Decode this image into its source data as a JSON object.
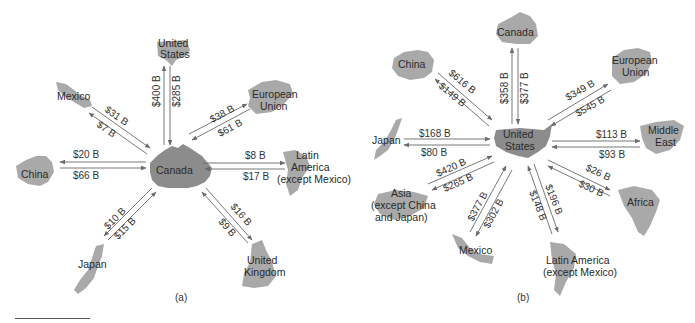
{
  "panels": [
    {
      "id": "a",
      "caption": "(a)",
      "hub": {
        "label": "Canada"
      },
      "partners": [
        {
          "key": "us",
          "label_lines": [
            "United",
            "States"
          ],
          "to_hub": "$400 B",
          "from_hub": "$285 B"
        },
        {
          "key": "eu",
          "label_lines": [
            "European",
            "Union"
          ],
          "to_hub": "$61 B",
          "from_hub": "$38 B"
        },
        {
          "key": "latam",
          "label_lines": [
            "Latin",
            "America",
            "(except Mexico)"
          ],
          "to_hub": "$17 B",
          "from_hub": "$8 B"
        },
        {
          "key": "uk",
          "label_lines": [
            "United",
            "Kingdom"
          ],
          "to_hub": "$9 B",
          "from_hub": "$16 B"
        },
        {
          "key": "japan",
          "label_lines": [
            "Japan"
          ],
          "to_hub": "$15 B",
          "from_hub": "$10 B"
        },
        {
          "key": "china",
          "label_lines": [
            "China"
          ],
          "to_hub": "$66 B",
          "from_hub": "$20 B"
        },
        {
          "key": "mexico",
          "label_lines": [
            "Mexico"
          ],
          "to_hub": "$31 B",
          "from_hub": "$7 B"
        }
      ]
    },
    {
      "id": "b",
      "caption": "(b)",
      "hub": {
        "label_lines": [
          "United",
          "States"
        ]
      },
      "partners": [
        {
          "key": "canada",
          "label_lines": [
            "Canada"
          ],
          "to_hub": "$377 B",
          "from_hub": "$358 B"
        },
        {
          "key": "eu",
          "label_lines": [
            "European",
            "Union"
          ],
          "to_hub": "$545 B",
          "from_hub": "$349 B"
        },
        {
          "key": "mideast",
          "label_lines": [
            "Middle",
            "East"
          ],
          "to_hub": "$93 B",
          "from_hub": "$113 B"
        },
        {
          "key": "africa",
          "label_lines": [
            "Africa"
          ],
          "to_hub": "$30 B",
          "from_hub": "$26 B"
        },
        {
          "key": "latam",
          "label_lines": [
            "Latin America",
            "(except Mexico)"
          ],
          "to_hub": "$148 B",
          "from_hub": "$196 B"
        },
        {
          "key": "mexico",
          "label_lines": [
            "Mexico"
          ],
          "to_hub": "$377 B",
          "from_hub": "$302 B"
        },
        {
          "key": "asia",
          "label_lines": [
            "Asia",
            "(except China",
            "and Japan)"
          ],
          "to_hub": "$420 B",
          "from_hub": "$265 B"
        },
        {
          "key": "japan",
          "label_lines": [
            "Japan"
          ],
          "to_hub": "$168 B",
          "from_hub": "$80 B"
        },
        {
          "key": "china",
          "label_lines": [
            "China"
          ],
          "to_hub": "$616 B",
          "from_hub": "$149 B"
        }
      ]
    }
  ],
  "colors": {
    "map_fill": "#a9a9a9",
    "hub_fill": "#8c8c8c",
    "arrow": "#6a6a6a",
    "text": "#2a2a2a"
  }
}
